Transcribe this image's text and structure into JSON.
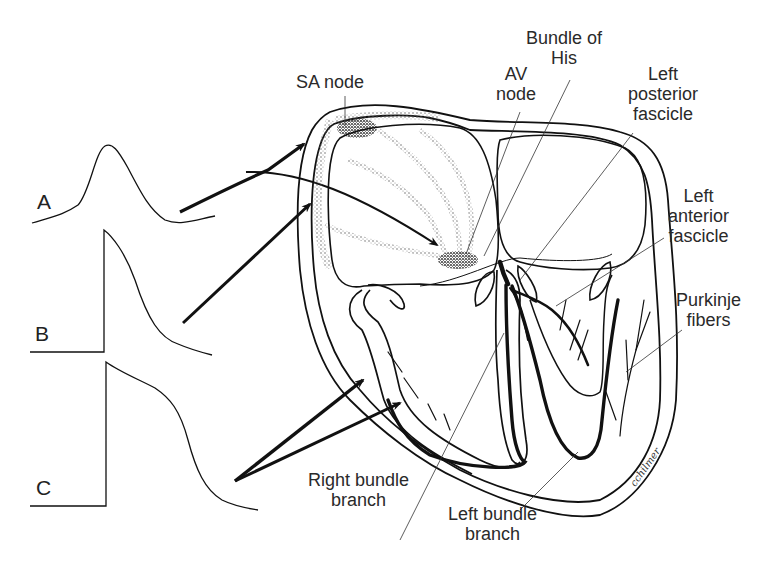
{
  "figure": {
    "background": "#ffffff",
    "ink_color": "#111111"
  },
  "labels": {
    "sa_node": "SA node",
    "av_node": [
      "AV",
      "node"
    ],
    "bundle_of_his": [
      "Bundle of",
      "His"
    ],
    "left_posterior_fascicle": [
      "Left",
      "posterior",
      "fascicle"
    ],
    "left_anterior_fascicle": [
      "Left",
      "anterior",
      "fascicle"
    ],
    "purkinje_fibers": [
      "Purkinje",
      "fibers"
    ],
    "right_bundle_branch": [
      "Right bundle",
      "branch"
    ],
    "left_bundle_branch": [
      "Left bundle",
      "branch"
    ]
  },
  "waveforms": [
    {
      "id": "A",
      "label": "A",
      "description": "slow-response (nodal) action potential"
    },
    {
      "id": "B",
      "label": "B",
      "description": "fast upstroke, rapid repolarization"
    },
    {
      "id": "C",
      "label": "C",
      "description": "fast upstroke with plateau (ventricular)"
    }
  ],
  "signature": "cchilmer"
}
